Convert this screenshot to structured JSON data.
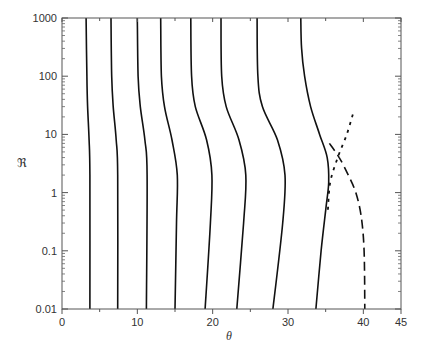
{
  "chart_data": {
    "type": "line",
    "title": "",
    "xlabel": "θ",
    "ylabel": "ℜ",
    "xlim": [
      0,
      45
    ],
    "ylim": [
      0.01,
      1000
    ],
    "yscale": "log",
    "grid": false,
    "legend": null,
    "x_ticks": [
      0,
      10,
      20,
      30,
      40,
      45
    ],
    "x_tick_labels": [
      "0",
      "10",
      "20",
      "30",
      "40",
      "45"
    ],
    "x_minor_ticks": [
      5,
      15,
      25,
      35
    ],
    "y_ticks": [
      0.01,
      0.1,
      1,
      10,
      100,
      1000
    ],
    "y_tick_labels": [
      "0.01",
      "0.1",
      "1",
      "10",
      "100",
      "1000"
    ],
    "series": [
      {
        "name": "curve-1",
        "style": "solid",
        "points": [
          [
            3.2,
            1000
          ],
          [
            3.3,
            100
          ],
          [
            3.4,
            30
          ],
          [
            3.6,
            8
          ],
          [
            3.7,
            2
          ],
          [
            3.7,
            0.01
          ]
        ]
      },
      {
        "name": "curve-2",
        "style": "solid",
        "points": [
          [
            6.5,
            1000
          ],
          [
            6.6,
            100
          ],
          [
            6.8,
            30
          ],
          [
            7.2,
            8
          ],
          [
            7.4,
            2
          ],
          [
            7.4,
            0.01
          ]
        ]
      },
      {
        "name": "curve-3",
        "style": "solid",
        "points": [
          [
            10.0,
            1000
          ],
          [
            10.1,
            100
          ],
          [
            10.4,
            30
          ],
          [
            11.0,
            8
          ],
          [
            11.3,
            2
          ],
          [
            11.2,
            0.01
          ]
        ]
      },
      {
        "name": "curve-4",
        "style": "solid",
        "points": [
          [
            13.1,
            1000
          ],
          [
            13.2,
            100
          ],
          [
            13.6,
            30
          ],
          [
            14.6,
            8
          ],
          [
            15.3,
            2
          ],
          [
            15.2,
            0.3
          ],
          [
            15.0,
            0.01
          ]
        ]
      },
      {
        "name": "curve-5",
        "style": "solid",
        "points": [
          [
            17.1,
            1000
          ],
          [
            17.2,
            100
          ],
          [
            17.7,
            30
          ],
          [
            19.2,
            8
          ],
          [
            19.9,
            2
          ],
          [
            19.7,
            0.3
          ],
          [
            19.0,
            0.01
          ]
        ]
      },
      {
        "name": "curve-6",
        "style": "solid",
        "points": [
          [
            21.1,
            1000
          ],
          [
            21.2,
            100
          ],
          [
            21.8,
            30
          ],
          [
            23.5,
            8
          ],
          [
            24.4,
            2
          ],
          [
            24.1,
            0.3
          ],
          [
            23.2,
            0.01
          ]
        ]
      },
      {
        "name": "curve-7",
        "style": "solid",
        "points": [
          [
            25.9,
            1000
          ],
          [
            26.0,
            100
          ],
          [
            26.6,
            30
          ],
          [
            28.6,
            8
          ],
          [
            29.6,
            2
          ],
          [
            29.3,
            0.3
          ],
          [
            28.0,
            0.01
          ]
        ]
      },
      {
        "name": "curve-8",
        "style": "solid",
        "points": [
          [
            31.7,
            1000
          ],
          [
            31.8,
            300
          ],
          [
            32.2,
            100
          ],
          [
            33.0,
            30
          ],
          [
            34.2,
            10
          ],
          [
            35.2,
            4
          ],
          [
            35.4,
            1.5
          ],
          [
            35.0,
            0.5
          ],
          [
            34.4,
            0.1
          ],
          [
            33.7,
            0.01
          ]
        ]
      },
      {
        "name": "dashed-boundary",
        "style": "dashed",
        "points": [
          [
            35.5,
            7
          ],
          [
            36.8,
            4
          ],
          [
            38.0,
            2
          ],
          [
            39.0,
            1
          ],
          [
            39.7,
            0.4
          ],
          [
            40.1,
            0.1
          ],
          [
            40.2,
            0.01
          ]
        ]
      },
      {
        "name": "dotted-boundary",
        "style": "dotted",
        "points": [
          [
            38.6,
            22
          ],
          [
            37.8,
            10
          ],
          [
            36.6,
            4
          ],
          [
            35.6,
            1.5
          ],
          [
            35.3,
            0.5
          ]
        ]
      }
    ]
  }
}
